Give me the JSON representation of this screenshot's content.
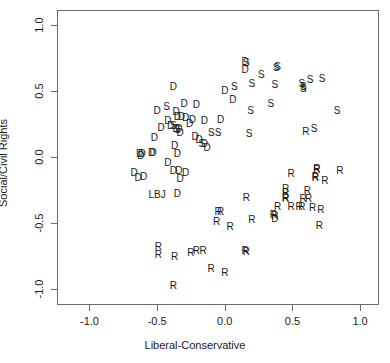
{
  "chart_data": {
    "type": "scatter",
    "title": "",
    "xlabel": "Liberal-Conservative",
    "ylabel": "Social/Civil Rights",
    "xlim": [
      -1.24,
      1.14
    ],
    "ylim": [
      -1.12,
      1.11
    ],
    "xticks": [
      -1.0,
      -0.5,
      0.0,
      0.5,
      1.0
    ],
    "xticklabels": [
      "-1.0",
      "-0.5",
      "0.0",
      "0.5",
      "1.0"
    ],
    "yticks": [
      -1.0,
      -0.5,
      0.0,
      0.5,
      1.0
    ],
    "yticklabels": [
      "-1.0",
      "-0.5",
      "0.0",
      "0.5",
      "1.0"
    ],
    "grid": false,
    "legend": null,
    "marker_style": "text-label",
    "groups": [
      "D",
      "R",
      "S",
      "LBJ"
    ],
    "points": [
      {
        "label": "D",
        "x": -0.38,
        "y": 0.53
      },
      {
        "label": "D",
        "x": -0.3,
        "y": 0.4
      },
      {
        "label": "S",
        "x": -0.43,
        "y": 0.38
      },
      {
        "label": "D",
        "x": -0.5,
        "y": 0.35
      },
      {
        "label": "D",
        "x": -0.36,
        "y": 0.34
      },
      {
        "label": "D",
        "x": -0.21,
        "y": 0.39
      },
      {
        "label": "D",
        "x": -0.35,
        "y": 0.3
      },
      {
        "label": "D",
        "x": -0.32,
        "y": 0.3
      },
      {
        "label": "D",
        "x": -0.29,
        "y": 0.29
      },
      {
        "label": "D",
        "x": -0.24,
        "y": 0.28
      },
      {
        "label": "D",
        "x": -0.26,
        "y": 0.25
      },
      {
        "label": "D",
        "x": -0.42,
        "y": 0.27
      },
      {
        "label": "D",
        "x": -0.4,
        "y": 0.23
      },
      {
        "label": "D",
        "x": -0.47,
        "y": 0.22
      },
      {
        "label": "S",
        "x": -0.38,
        "y": 0.23
      },
      {
        "label": "D",
        "x": -0.36,
        "y": 0.21
      },
      {
        "label": "D",
        "x": -0.34,
        "y": 0.21
      },
      {
        "label": "S",
        "x": -0.35,
        "y": 0.2
      },
      {
        "label": "D",
        "x": -0.33,
        "y": 0.18
      },
      {
        "label": "D",
        "x": -0.15,
        "y": 0.27
      },
      {
        "label": "D",
        "x": -0.52,
        "y": 0.14
      },
      {
        "label": "D",
        "x": -0.22,
        "y": 0.15
      },
      {
        "label": "D",
        "x": -0.19,
        "y": 0.13
      },
      {
        "label": "S",
        "x": -0.17,
        "y": 0.1
      },
      {
        "label": "D",
        "x": -0.15,
        "y": 0.1
      },
      {
        "label": "D",
        "x": -0.13,
        "y": 0.07
      },
      {
        "label": "S",
        "x": -0.1,
        "y": 0.18
      },
      {
        "label": "D",
        "x": -0.37,
        "y": 0.08
      },
      {
        "label": "D",
        "x": -0.35,
        "y": 0.02
      },
      {
        "label": "D",
        "x": -0.63,
        "y": 0.02
      },
      {
        "label": "D",
        "x": -0.62,
        "y": 0.01
      },
      {
        "label": "D",
        "x": -0.61,
        "y": 0.02
      },
      {
        "label": "D",
        "x": -0.54,
        "y": 0.03
      },
      {
        "label": "D",
        "x": -0.53,
        "y": 0.03
      },
      {
        "label": "D",
        "x": -0.42,
        "y": -0.05
      },
      {
        "label": "D",
        "x": -0.38,
        "y": -0.11
      },
      {
        "label": "D",
        "x": -0.34,
        "y": -0.11
      },
      {
        "label": "D",
        "x": -0.29,
        "y": -0.12
      },
      {
        "label": "D",
        "x": -0.33,
        "y": -0.17
      },
      {
        "label": "D",
        "x": -0.67,
        "y": -0.12
      },
      {
        "label": "D",
        "x": -0.64,
        "y": -0.16
      },
      {
        "label": "D",
        "x": -0.6,
        "y": -0.15
      },
      {
        "label": "LBJ",
        "x": -0.5,
        "y": -0.29
      },
      {
        "label": "D",
        "x": -0.35,
        "y": -0.28
      },
      {
        "label": "D",
        "x": 0.15,
        "y": 0.72
      },
      {
        "label": "S",
        "x": 0.16,
        "y": 0.71
      },
      {
        "label": "D",
        "x": 0.15,
        "y": 0.66
      },
      {
        "label": "S",
        "x": 0.38,
        "y": 0.67
      },
      {
        "label": "S",
        "x": 0.39,
        "y": 0.68
      },
      {
        "label": "S",
        "x": 0.27,
        "y": 0.62
      },
      {
        "label": "S",
        "x": 0.63,
        "y": 0.58
      },
      {
        "label": "S",
        "x": 0.72,
        "y": 0.59
      },
      {
        "label": "S",
        "x": 0.57,
        "y": 0.55
      },
      {
        "label": "S",
        "x": 0.58,
        "y": 0.53
      },
      {
        "label": "S",
        "x": 0.58,
        "y": 0.51
      },
      {
        "label": "S",
        "x": 0.37,
        "y": 0.54
      },
      {
        "label": "S",
        "x": 0.2,
        "y": 0.55
      },
      {
        "label": "S",
        "x": 0.07,
        "y": 0.53
      },
      {
        "label": "D",
        "x": 0.0,
        "y": 0.5
      },
      {
        "label": "D",
        "x": 0.06,
        "y": 0.43
      },
      {
        "label": "S",
        "x": 0.34,
        "y": 0.4
      },
      {
        "label": "S",
        "x": 0.19,
        "y": 0.35
      },
      {
        "label": "S",
        "x": 0.83,
        "y": 0.35
      },
      {
        "label": "D",
        "x": -0.03,
        "y": 0.28
      },
      {
        "label": "S",
        "x": -0.05,
        "y": 0.18
      },
      {
        "label": "S",
        "x": 0.66,
        "y": 0.21
      },
      {
        "label": "R",
        "x": 0.6,
        "y": 0.19
      },
      {
        "label": "S",
        "x": 0.18,
        "y": 0.17
      },
      {
        "label": "R",
        "x": 0.68,
        "y": -0.09
      },
      {
        "label": "R",
        "x": 0.68,
        "y": -0.1
      },
      {
        "label": "R",
        "x": 0.85,
        "y": -0.11
      },
      {
        "label": "R",
        "x": 0.49,
        "y": -0.13
      },
      {
        "label": "R",
        "x": 0.67,
        "y": -0.15
      },
      {
        "label": "R",
        "x": 0.67,
        "y": -0.16
      },
      {
        "label": "R",
        "x": 0.74,
        "y": -0.18
      },
      {
        "label": "R",
        "x": 0.45,
        "y": -0.24
      },
      {
        "label": "R",
        "x": 0.45,
        "y": -0.27
      },
      {
        "label": "R",
        "x": 0.61,
        "y": -0.26
      },
      {
        "label": "R",
        "x": 0.45,
        "y": -0.31
      },
      {
        "label": "R",
        "x": 0.45,
        "y": -0.32
      },
      {
        "label": "R",
        "x": 0.58,
        "y": -0.32
      },
      {
        "label": "R",
        "x": 0.62,
        "y": -0.32
      },
      {
        "label": "R",
        "x": 0.16,
        "y": -0.31
      },
      {
        "label": "R",
        "x": 0.39,
        "y": -0.38
      },
      {
        "label": "R",
        "x": 0.49,
        "y": -0.38
      },
      {
        "label": "R",
        "x": 0.55,
        "y": -0.38
      },
      {
        "label": "R",
        "x": 0.57,
        "y": -0.38
      },
      {
        "label": "R",
        "x": 0.65,
        "y": -0.39
      },
      {
        "label": "R",
        "x": 0.71,
        "y": -0.4
      },
      {
        "label": "R",
        "x": -0.05,
        "y": -0.42
      },
      {
        "label": "R",
        "x": -0.03,
        "y": -0.42
      },
      {
        "label": "R",
        "x": 0.36,
        "y": -0.44
      },
      {
        "label": "R",
        "x": 0.37,
        "y": -0.45
      },
      {
        "label": "D",
        "x": 0.37,
        "y": -0.47
      },
      {
        "label": "R",
        "x": -0.06,
        "y": -0.49
      },
      {
        "label": "R",
        "x": 0.2,
        "y": -0.48
      },
      {
        "label": "R",
        "x": 0.04,
        "y": -0.53
      },
      {
        "label": "R",
        "x": 0.7,
        "y": -0.52
      },
      {
        "label": "R",
        "x": -0.49,
        "y": -0.68
      },
      {
        "label": "R",
        "x": -0.49,
        "y": -0.74
      },
      {
        "label": "R",
        "x": -0.37,
        "y": -0.76
      },
      {
        "label": "R",
        "x": -0.25,
        "y": -0.73
      },
      {
        "label": "R",
        "x": -0.21,
        "y": -0.71
      },
      {
        "label": "R",
        "x": -0.16,
        "y": -0.71
      },
      {
        "label": "R",
        "x": 0.15,
        "y": -0.71
      },
      {
        "label": "R",
        "x": 0.16,
        "y": -0.72
      },
      {
        "label": "R",
        "x": -0.1,
        "y": -0.85
      },
      {
        "label": "R",
        "x": 0.0,
        "y": -0.88
      },
      {
        "label": "R",
        "x": -0.38,
        "y": -0.98
      }
    ]
  },
  "axes": {
    "x_title": "Liberal-Conservative",
    "y_title": "Social/Civil Rights"
  }
}
